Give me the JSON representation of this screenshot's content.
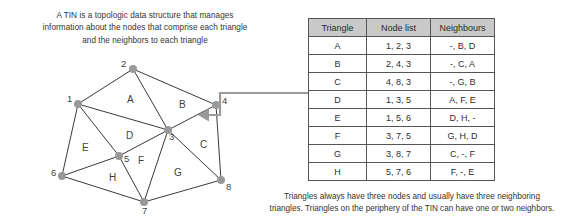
{
  "intro_caption": {
    "lines": [
      "A TIN is a topologic data structure that manages",
      "information about the nodes that comprise each triangle",
      "and the neighbors to each triangle"
    ]
  },
  "bottom_caption": {
    "lines": [
      "Triangles always have three nodes and usually have three neighboring",
      "triangles. Triangles on the periphery of the TIN can have one or two neighbors."
    ]
  },
  "diagram": {
    "nodes": [
      {
        "id": "1",
        "label": "1",
        "x": 78,
        "y": 104,
        "label_dx": -11,
        "label_dy": -5
      },
      {
        "id": "2",
        "label": "2",
        "x": 133,
        "y": 69,
        "label_dx": -12,
        "label_dy": -5
      },
      {
        "id": "3",
        "label": "3",
        "x": 168,
        "y": 130,
        "label_dx": 1,
        "label_dy": 7
      },
      {
        "id": "4",
        "label": "4",
        "x": 216,
        "y": 105,
        "label_dx": 6,
        "label_dy": -4
      },
      {
        "id": "5",
        "label": "5",
        "x": 119,
        "y": 156,
        "label_dx": 5,
        "label_dy": 3
      },
      {
        "id": "6",
        "label": "6",
        "x": 62,
        "y": 176,
        "label_dx": -11,
        "label_dy": -3
      },
      {
        "id": "7",
        "label": "7",
        "x": 144,
        "y": 202,
        "label_dx": -2,
        "label_dy": 9
      },
      {
        "id": "8",
        "label": "8",
        "x": 221,
        "y": 180,
        "label_dx": 5,
        "label_dy": 7
      }
    ],
    "edges": [
      [
        "1",
        "2"
      ],
      [
        "2",
        "3"
      ],
      [
        "2",
        "4"
      ],
      [
        "1",
        "3"
      ],
      [
        "3",
        "4"
      ],
      [
        "4",
        "8"
      ],
      [
        "3",
        "8"
      ],
      [
        "1",
        "5"
      ],
      [
        "1",
        "6"
      ],
      [
        "3",
        "5"
      ],
      [
        "5",
        "6"
      ],
      [
        "5",
        "7"
      ],
      [
        "3",
        "7"
      ],
      [
        "6",
        "7"
      ],
      [
        "7",
        "8"
      ]
    ],
    "triangle_labels": [
      {
        "name": "A",
        "x": 130,
        "y": 100
      },
      {
        "name": "B",
        "x": 182,
        "y": 105
      },
      {
        "name": "C",
        "x": 203,
        "y": 145
      },
      {
        "name": "D",
        "x": 129,
        "y": 136
      },
      {
        "name": "E",
        "x": 85,
        "y": 148
      },
      {
        "name": "F",
        "x": 141,
        "y": 161
      },
      {
        "name": "G",
        "x": 177,
        "y": 173
      },
      {
        "name": "H",
        "x": 112,
        "y": 178
      }
    ],
    "node_color": "#999999",
    "edge_color": "#3a3a3a",
    "connector_color": "#9a9a9a"
  },
  "table": {
    "headers": [
      "Triangle",
      "Node list",
      "Neighbours"
    ],
    "rows": [
      {
        "triangle": "A",
        "nodes": "1, 2, 3",
        "neighbours": "-, B, D"
      },
      {
        "triangle": "B",
        "nodes": "2, 4, 3",
        "neighbours": "-, C, A"
      },
      {
        "triangle": "C",
        "nodes": "4, 8, 3",
        "neighbours": "-, G, B"
      },
      {
        "triangle": "D",
        "nodes": "1, 3, 5",
        "neighbours": "A, F, E"
      },
      {
        "triangle": "E",
        "nodes": "1, 5, 6",
        "neighbours": "D, H, -"
      },
      {
        "triangle": "F",
        "nodes": "3, 7, 5",
        "neighbours": "G, H, D"
      },
      {
        "triangle": "G",
        "nodes": "3, 8, 7",
        "neighbours": "C, -, F"
      },
      {
        "triangle": "H",
        "nodes": "5, 7, 6",
        "neighbours": "F, -, E"
      }
    ],
    "header_bg": "#c9c9c9",
    "border_color": "#555555"
  }
}
